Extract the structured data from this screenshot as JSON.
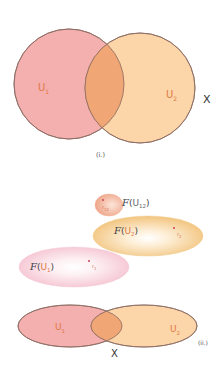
{
  "colors": {
    "u1_fill": "#f4aeae",
    "u2_fill": "#fbd3a6",
    "overlap_fill": "#f2a774",
    "outline": "#8a6a60",
    "label_orange": "#e0763a",
    "text_dark": "#333333",
    "f_u1_edge": "#f5c6d4",
    "f_u2_edge": "#f3c785",
    "f_u12_edge": "#f0a98f",
    "point": "#d0445a"
  },
  "panel_i": {
    "caption": "(i.)",
    "space_label": "X",
    "sets": [
      {
        "name": "U",
        "sub": "1"
      },
      {
        "name": "U",
        "sub": "2"
      }
    ]
  },
  "panel_ii": {
    "caption": "(ii.)",
    "space_label": "X",
    "base_sets": [
      {
        "name": "U",
        "sub": "1"
      },
      {
        "name": "U",
        "sub": "2"
      }
    ],
    "fibers": [
      {
        "label_prefix": "F(",
        "set": "U",
        "sub": "12",
        "suffix": ")",
        "point": "r",
        "point_sub": "12"
      },
      {
        "label_prefix": "F(",
        "set": "U",
        "sub": "2",
        "suffix": ")",
        "point": "r",
        "point_sub": "2"
      },
      {
        "label_prefix": "F(",
        "set": "U",
        "sub": "1",
        "suffix": ")",
        "point": "r",
        "point_sub": "1"
      }
    ]
  }
}
